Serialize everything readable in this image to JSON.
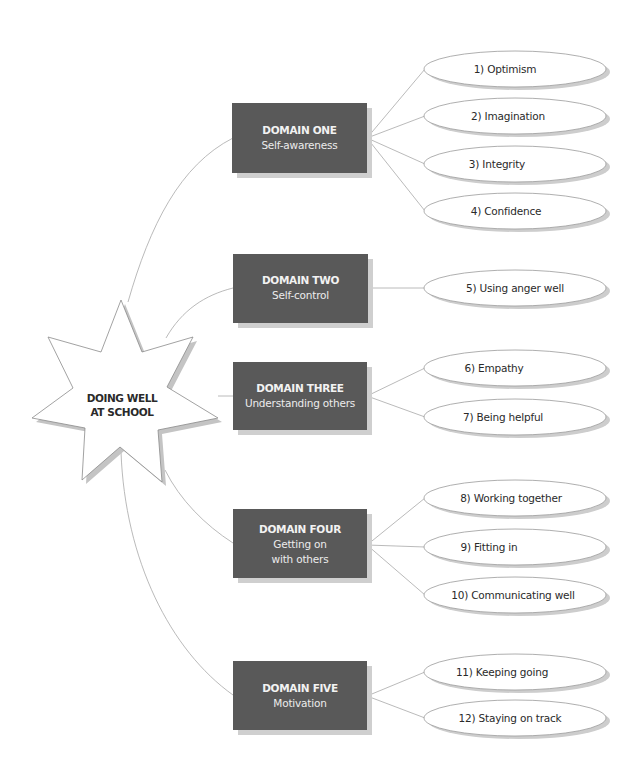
{
  "center": {
    "label_line1": "DOING WELL",
    "label_line2": "AT SCHOOL"
  },
  "domains": [
    {
      "title": "DOMAIN ONE",
      "subtitle_lines": [
        "Self-awareness"
      ],
      "skills": [
        "1)  Optimism",
        "2)  Imagination",
        "3)  Integrity",
        "4)  Confidence"
      ]
    },
    {
      "title": "DOMAIN TWO",
      "subtitle_lines": [
        "Self-control"
      ],
      "skills": [
        "5)  Using anger well"
      ]
    },
    {
      "title": "DOMAIN THREE",
      "subtitle_lines": [
        "Understanding others"
      ],
      "skills": [
        "6)  Empathy",
        "7)  Being helpful"
      ]
    },
    {
      "title": "DOMAIN FOUR",
      "subtitle_lines": [
        "Getting on",
        "with others"
      ],
      "skills": [
        "8)  Working together",
        "9)  Fitting in",
        "10)  Communicating well"
      ]
    },
    {
      "title": "DOMAIN FIVE",
      "subtitle_lines": [
        "Motivation"
      ],
      "skills": [
        "11)  Keeping going",
        "12)  Staying on track"
      ]
    }
  ],
  "colors": {
    "box_fill": "#595959",
    "box_text": "#f2f2f2",
    "connector": "#a8a8a8",
    "shadow": "#cdcdcd",
    "text": "#2a2a2a"
  }
}
